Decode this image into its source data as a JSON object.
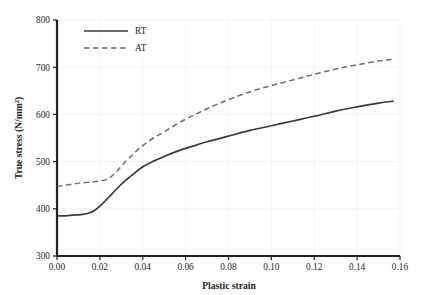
{
  "chart_data": {
    "type": "line",
    "title": "",
    "xlabel": "Plastic strain",
    "ylabel": "True stress (N/mm",
    "ylabel_superscript": "2",
    "ylabel_suffix": ")",
    "xlim": [
      0.0,
      0.16
    ],
    "ylim": [
      300,
      800
    ],
    "xticks": [
      "0.00",
      "0.02",
      "0.04",
      "0.06",
      "0.08",
      "0.10",
      "0.12",
      "0.14",
      "0.16"
    ],
    "xtick_values": [
      0.0,
      0.02,
      0.04,
      0.06,
      0.08,
      0.1,
      0.12,
      0.14,
      0.16
    ],
    "yticks": [
      "300",
      "400",
      "500",
      "600",
      "700",
      "800"
    ],
    "ytick_values": [
      300,
      400,
      500,
      600,
      700,
      800
    ],
    "grid": true,
    "grid_color": "#f4f4f4",
    "axis_color": "#231f20",
    "legend_position": "upper-left-inside",
    "series": [
      {
        "name": "RT",
        "style": "solid",
        "color": "#3b3b3b",
        "x": [
          0.0,
          0.003,
          0.006,
          0.009,
          0.012,
          0.015,
          0.018,
          0.021,
          0.024,
          0.028,
          0.032,
          0.036,
          0.04,
          0.045,
          0.05,
          0.055,
          0.06,
          0.065,
          0.07,
          0.08,
          0.09,
          0.1,
          0.11,
          0.12,
          0.13,
          0.14,
          0.15,
          0.157
        ],
        "y": [
          385,
          385,
          386,
          387,
          388,
          391,
          398,
          410,
          424,
          443,
          460,
          475,
          489,
          501,
          511,
          520,
          528,
          535,
          542,
          554,
          566,
          576,
          586,
          596,
          607,
          616,
          624,
          628
        ]
      },
      {
        "name": "AT",
        "style": "dashed",
        "color": "#6e6e6e",
        "x": [
          0.0,
          0.004,
          0.008,
          0.012,
          0.016,
          0.02,
          0.024,
          0.028,
          0.032,
          0.036,
          0.04,
          0.045,
          0.05,
          0.055,
          0.06,
          0.065,
          0.07,
          0.075,
          0.08,
          0.09,
          0.1,
          0.11,
          0.12,
          0.13,
          0.14,
          0.15,
          0.157
        ],
        "y": [
          447,
          450,
          453,
          455,
          457,
          459,
          464,
          480,
          500,
          518,
          534,
          550,
          563,
          577,
          590,
          601,
          612,
          622,
          631,
          648,
          661,
          673,
          685,
          696,
          705,
          713,
          717
        ]
      }
    ],
    "legend": [
      {
        "label": "RT",
        "style": "solid",
        "color": "#3b3b3b"
      },
      {
        "label": "AT",
        "style": "dashed",
        "color": "#6e6e6e"
      }
    ]
  }
}
